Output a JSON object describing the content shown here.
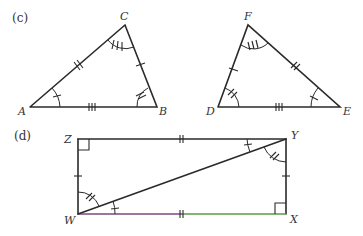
{
  "figure": {
    "colors": {
      "stroke": "#2a2a2a",
      "bottom_left": "#7a4a7a",
      "bottom_right": "#5a9a4a"
    },
    "part_c": {
      "label": "(c)",
      "triangle_abc": {
        "vertices": {
          "A": "A",
          "B": "B",
          "C": "C"
        },
        "marks": {
          "AC": "double tick",
          "CB": "single tick",
          "AB": "triple tick",
          "angle_A": "single arc tick",
          "angle_B": "double arc tick",
          "angle_C": "triple arc tick"
        }
      },
      "triangle_def": {
        "vertices": {
          "D": "D",
          "E": "E",
          "F": "F"
        },
        "marks": {
          "DF": "single tick",
          "FE": "double tick",
          "DE": "triple tick",
          "angle_D": "double arc tick",
          "angle_E": "single arc tick",
          "angle_F": "triple arc tick"
        }
      }
    },
    "part_d": {
      "label": "(d)",
      "rectangle_wxyz": {
        "vertices": {
          "W": "W",
          "X": "X",
          "Y": "Y",
          "Z": "Z"
        },
        "diagonal": "WY",
        "marks": {
          "ZY": "double tick",
          "WX": "double tick",
          "ZW": "single tick",
          "YX": "single tick",
          "angle_Z": "right angle",
          "angle_X": "right angle",
          "angle_ZWY": "double arc tick",
          "angle_YWX": "single arc tick",
          "angle_ZYW": "single arc tick",
          "angle_WYX": "double arc tick"
        }
      }
    }
  }
}
